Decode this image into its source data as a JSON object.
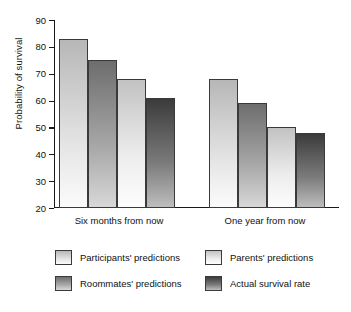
{
  "chart_data": {
    "type": "bar",
    "title": "",
    "xlabel": "",
    "ylabel": "Probability of survival",
    "ylim": [
      20,
      90
    ],
    "yticks": [
      20,
      30,
      40,
      50,
      60,
      70,
      80,
      90
    ],
    "ytick_labels": [
      "20",
      "30",
      "40",
      "50",
      "60",
      "70",
      "80",
      "90"
    ],
    "grid": false,
    "legend_position": "bottom",
    "legend_columns": 2,
    "categories": [
      "Six months from now",
      "One year from now"
    ],
    "series": [
      {
        "name": "Participants' predictions",
        "color": "#d0d0d0",
        "values": [
          83,
          68
        ]
      },
      {
        "name": "Roommates' predictions",
        "color": "#8a8a8a",
        "values": [
          75,
          59
        ]
      },
      {
        "name": "Parents' predictions",
        "color": "#e4e4e4",
        "values": [
          68,
          50
        ]
      },
      {
        "name": "Actual survival rate",
        "color": "#4a4a4a",
        "values": [
          61,
          48
        ]
      }
    ]
  },
  "axis": {
    "y_label": "Probability of survival",
    "tick_20": "20",
    "tick_30": "30",
    "tick_40": "40",
    "tick_50": "50",
    "tick_60": "60",
    "tick_70": "70",
    "tick_80": "80",
    "tick_90": "90"
  },
  "categories": {
    "group_0": "Six months from now",
    "group_1": "One year from now"
  },
  "legend": {
    "item_0": "Participants' predictions",
    "item_1": "Roommates' predictions",
    "item_2": "Parents' predictions",
    "item_3": "Actual survival rate"
  }
}
